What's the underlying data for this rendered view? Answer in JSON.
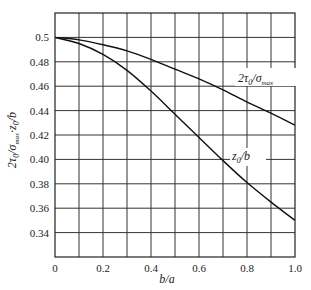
{
  "chart_data": {
    "type": "line",
    "title": "",
    "xlabel": "b/a",
    "ylabel": "2τ₀/σmax, z₀/b",
    "xlim": [
      0,
      1.0
    ],
    "ylim": [
      0.32,
      0.52
    ],
    "grid": true,
    "x_ticks": [
      "0",
      "0.2",
      "0.4",
      "0.6",
      "0.8",
      "1.0"
    ],
    "y_ticks": [
      "0.34",
      "0.36",
      "0.38",
      "0.40",
      "0.42",
      "0.44",
      "0.46",
      "0.48",
      "0.5"
    ],
    "x": [
      0,
      0.1,
      0.2,
      0.3,
      0.4,
      0.5,
      0.6,
      0.7,
      0.8,
      0.9,
      1.0
    ],
    "series": [
      {
        "name": "2τ₀/σmax",
        "values": [
          0.5,
          0.498,
          0.494,
          0.489,
          0.482,
          0.474,
          0.466,
          0.457,
          0.447,
          0.438,
          0.428
        ]
      },
      {
        "name": "z₀/b",
        "values": [
          0.5,
          0.495,
          0.486,
          0.473,
          0.456,
          0.437,
          0.418,
          0.399,
          0.381,
          0.365,
          0.35
        ]
      }
    ],
    "annotations": [
      "2τ₀/σmax",
      "z₀/b"
    ]
  }
}
